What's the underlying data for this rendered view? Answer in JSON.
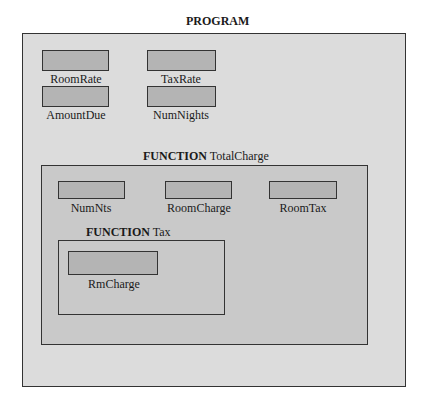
{
  "program": {
    "keyword": "PROGRAM",
    "variables": [
      {
        "name": "RoomRate"
      },
      {
        "name": "TaxRate"
      },
      {
        "name": "AmountDue"
      },
      {
        "name": "NumNights"
      }
    ]
  },
  "function_total": {
    "keyword": "FUNCTION",
    "name": " TotalCharge",
    "variables": [
      {
        "name": "NumNts"
      },
      {
        "name": "RoomCharge"
      },
      {
        "name": "RoomTax"
      }
    ]
  },
  "function_tax": {
    "keyword": "FUNCTION",
    "name": " Tax",
    "variables": [
      {
        "name": "RmCharge"
      }
    ]
  },
  "colors": {
    "program_bg": "#dcdcdc",
    "function_bg": "#c9c9c9",
    "variable_fill": "#b4b4b4",
    "border": "#333333"
  }
}
